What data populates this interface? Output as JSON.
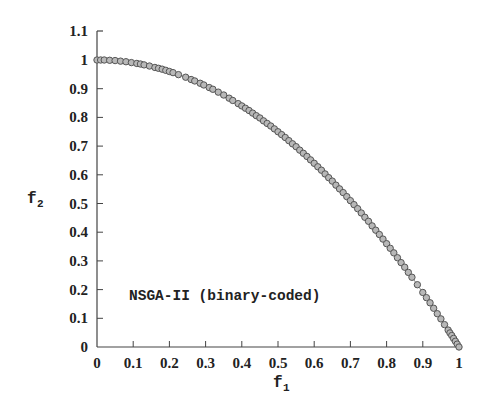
{
  "chart_data": {
    "type": "scatter",
    "title": "",
    "xlabel": "f1",
    "ylabel": "f2",
    "xlim": [
      0,
      1
    ],
    "ylim": [
      0,
      1.1
    ],
    "xticks": [
      "0",
      "0.1",
      "0.2",
      "0.3",
      "0.4",
      "0.5",
      "0.6",
      "0.7",
      "0.8",
      "0.9",
      "1"
    ],
    "yticks": [
      "0",
      "0.1",
      "0.2",
      "0.3",
      "0.4",
      "0.5",
      "0.6",
      "0.7",
      "0.8",
      "0.9",
      "1",
      "1.1"
    ],
    "grid": false,
    "annotation": "NSGA-II (binary-coded)",
    "series": [
      {
        "name": "NSGA-II (binary-coded)",
        "marker": "circle",
        "marker_fill": "#b8b8b8",
        "marker_stroke": "#555555",
        "line": "true Pareto front f2 = 1 - f1^2",
        "x": [
          0.0,
          0.01,
          0.02,
          0.035,
          0.05,
          0.065,
          0.08,
          0.095,
          0.11,
          0.12,
          0.13,
          0.145,
          0.16,
          0.17,
          0.18,
          0.19,
          0.2,
          0.21,
          0.225,
          0.245,
          0.26,
          0.27,
          0.285,
          0.295,
          0.31,
          0.32,
          0.335,
          0.35,
          0.365,
          0.375,
          0.39,
          0.4,
          0.41,
          0.42,
          0.43,
          0.44,
          0.45,
          0.46,
          0.47,
          0.48,
          0.49,
          0.5,
          0.51,
          0.52,
          0.53,
          0.54,
          0.55,
          0.56,
          0.57,
          0.58,
          0.59,
          0.6,
          0.61,
          0.62,
          0.63,
          0.64,
          0.65,
          0.66,
          0.67,
          0.68,
          0.69,
          0.7,
          0.71,
          0.72,
          0.73,
          0.74,
          0.75,
          0.76,
          0.77,
          0.78,
          0.79,
          0.8,
          0.81,
          0.82,
          0.83,
          0.84,
          0.85,
          0.86,
          0.87,
          0.885,
          0.9,
          0.91,
          0.92,
          0.93,
          0.94,
          0.95,
          0.96,
          0.97,
          0.975,
          0.98,
          0.985,
          0.99,
          0.995,
          1.0
        ],
        "y": [
          1.0,
          1.0,
          1.0,
          0.999,
          0.998,
          0.996,
          0.994,
          0.991,
          0.988,
          0.986,
          0.983,
          0.979,
          0.974,
          0.971,
          0.968,
          0.964,
          0.96,
          0.956,
          0.949,
          0.94,
          0.932,
          0.927,
          0.919,
          0.913,
          0.904,
          0.898,
          0.888,
          0.878,
          0.867,
          0.859,
          0.848,
          0.84,
          0.832,
          0.824,
          0.815,
          0.806,
          0.798,
          0.788,
          0.779,
          0.77,
          0.76,
          0.75,
          0.74,
          0.73,
          0.719,
          0.708,
          0.698,
          0.686,
          0.675,
          0.664,
          0.652,
          0.64,
          0.628,
          0.616,
          0.603,
          0.59,
          0.578,
          0.564,
          0.551,
          0.538,
          0.524,
          0.51,
          0.496,
          0.482,
          0.467,
          0.452,
          0.438,
          0.422,
          0.407,
          0.392,
          0.376,
          0.36,
          0.344,
          0.328,
          0.311,
          0.294,
          0.278,
          0.26,
          0.243,
          0.217,
          0.19,
          0.172,
          0.154,
          0.135,
          0.116,
          0.098,
          0.078,
          0.059,
          0.049,
          0.04,
          0.03,
          0.02,
          0.01,
          0.0
        ]
      }
    ]
  },
  "labels": {
    "x_axis_title": "f",
    "x_axis_sub": "1",
    "y_axis_title": "f",
    "y_axis_sub": "2",
    "annotation": "NSGA-II (binary-coded)"
  }
}
